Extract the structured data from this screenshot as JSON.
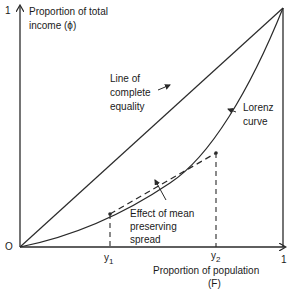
{
  "diagram": {
    "type": "lorenz-curve",
    "y_axis": {
      "label_line1": "Proportion of total",
      "label_line2": "income (ϕ)",
      "max_tick": "1"
    },
    "x_axis": {
      "label_line1": "Proportion of population",
      "label_line2": "(F)",
      "max_tick": "1",
      "ticks": [
        "y1",
        "y2"
      ]
    },
    "origin_label": "O",
    "tick_y1": {
      "base": "y",
      "sub": "1"
    },
    "tick_y2": {
      "base": "y",
      "sub": "2"
    },
    "annotations": {
      "equality_line1": "Line of",
      "equality_line2": "complete",
      "equality_line3": "equality",
      "lorenz_line1": "Lorenz",
      "lorenz_line2": "curve",
      "effect_line1": "Effect of mean",
      "effect_line2": "preserving",
      "effect_line3": "spread"
    },
    "colors": {
      "stroke": "#2a2a2a",
      "background": "#ffffff"
    }
  }
}
